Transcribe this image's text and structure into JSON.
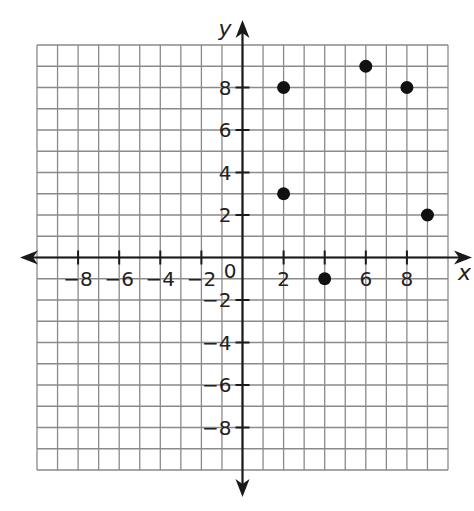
{
  "chart_data": {
    "type": "scatter",
    "title": "",
    "xlabel": "x",
    "ylabel": "y",
    "xlim": [
      -10,
      10
    ],
    "ylim": [
      -10,
      10
    ],
    "grid": true,
    "grid_step": 1,
    "legend": null,
    "x_ticks": [
      -8,
      -6,
      -4,
      -2,
      2,
      4,
      6,
      8
    ],
    "x_tick_labels": [
      "−8",
      "−6",
      "−4",
      "−2",
      "2",
      "",
      "6",
      "8"
    ],
    "y_ticks": [
      -8,
      -6,
      -4,
      -2,
      2,
      4,
      6,
      8
    ],
    "y_tick_labels": [
      "−8",
      "−6",
      "−4",
      "−2",
      "2",
      "4",
      "6",
      "8"
    ],
    "origin_label": "0",
    "series": [
      {
        "name": "points",
        "points": [
          {
            "x": 2,
            "y": 8
          },
          {
            "x": 6,
            "y": 9
          },
          {
            "x": 8,
            "y": 8
          },
          {
            "x": 2,
            "y": 3
          },
          {
            "x": 9,
            "y": 2
          },
          {
            "x": 4,
            "y": -1
          }
        ]
      }
    ]
  },
  "style": {
    "grid_color": "#8a8a8a",
    "axis_color": "#1a1a1a",
    "point_color": "#111111"
  },
  "layout": {
    "grid_left": 37,
    "grid_right": 448,
    "grid_top": 45,
    "grid_bottom": 470
  }
}
